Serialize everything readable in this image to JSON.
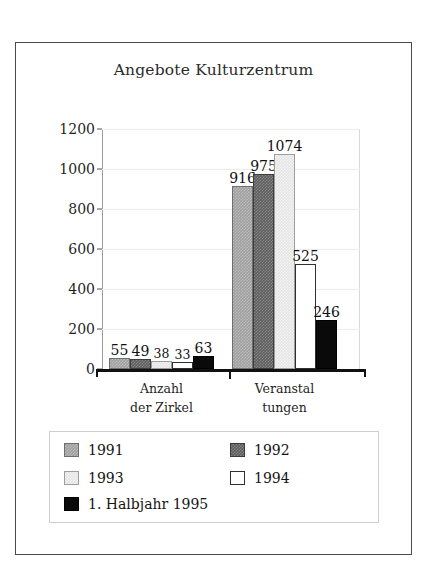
{
  "chart_data": {
    "type": "bar",
    "title": "Angebote Kulturzentrum",
    "xlabel": "",
    "ylabel": "",
    "ylim": [
      0,
      1200
    ],
    "yticks": [
      0,
      200,
      400,
      600,
      800,
      1000,
      1200
    ],
    "ytick_labels": [
      "0",
      "200",
      "400",
      "600",
      "800",
      "1000",
      "1200"
    ],
    "grid": true,
    "legend_position": "below-axes",
    "categories": [
      "Anzahl der Zirkel",
      "Veranstaltungen"
    ],
    "category_lines": [
      [
        "Anzahl",
        "der Zirkel"
      ],
      [
        "Veranstal",
        "tungen"
      ]
    ],
    "series": [
      {
        "name": "1991",
        "color": "#9e9e9e",
        "values": [
          55,
          916
        ]
      },
      {
        "name": "1992",
        "color": "#5e5e5e",
        "values": [
          49,
          975
        ]
      },
      {
        "name": "1993",
        "color": "#e4e4e4",
        "values": [
          38,
          1074
        ]
      },
      {
        "name": "1994",
        "color": "#ffffff",
        "values": [
          33,
          525
        ]
      },
      {
        "name": "1. Halbjahr 1995",
        "color": "#0a0a0a",
        "values": [
          63,
          246
        ]
      }
    ],
    "data_labels": {
      "group1": [
        "55",
        "49",
        "38",
        "33",
        "63"
      ],
      "group2": [
        "916",
        "975",
        "1074",
        "525",
        "246"
      ]
    }
  },
  "legend": {
    "entries": [
      {
        "label": "1991",
        "swatch": "swatch-1991"
      },
      {
        "label": "1992",
        "swatch": "swatch-1992"
      },
      {
        "label": "1993",
        "swatch": "swatch-1993"
      },
      {
        "label": "1994",
        "swatch": "swatch-1994"
      },
      {
        "label": "1. Halbjahr 1995",
        "swatch": "swatch-1995"
      }
    ]
  }
}
